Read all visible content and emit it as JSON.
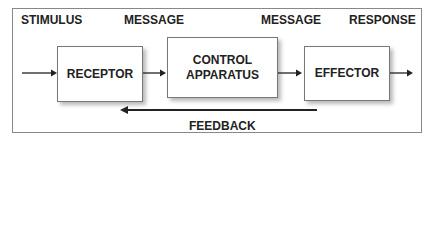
{
  "diagram": {
    "labels": {
      "stimulus": "STIMULUS",
      "message_1": "MESSAGE",
      "message_2": "MESSAGE",
      "response": "RESPONSE",
      "feedback": "FEEDBACK"
    },
    "boxes": {
      "receptor": "RECEPTOR",
      "control_line1": "CONTROL",
      "control_line2": "APPARATUS",
      "effector": "EFFECTOR"
    },
    "flow": [
      "STIMULUS",
      "RECEPTOR",
      "MESSAGE",
      "CONTROL APPARATUS",
      "MESSAGE",
      "EFFECTOR",
      "RESPONSE"
    ],
    "feedback_direction": "from EFFECTOR back to RECEPTOR"
  }
}
